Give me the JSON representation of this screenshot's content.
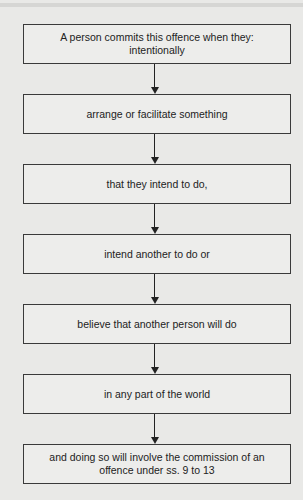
{
  "diagram": {
    "type": "flowchart",
    "direction": "top-to-bottom",
    "steps": [
      {
        "lines": [
          "A person commits this offence when they:",
          "intentionally"
        ]
      },
      {
        "lines": [
          "arrange or facilitate something"
        ]
      },
      {
        "lines": [
          "that they intend to do,"
        ]
      },
      {
        "lines": [
          "intend another to do or"
        ]
      },
      {
        "lines": [
          "believe that another person will do"
        ]
      },
      {
        "lines": [
          "in any part of the world"
        ]
      },
      {
        "lines": [
          "and doing so will involve the commission of an",
          "offence under ss. 9 to 13"
        ]
      }
    ],
    "colors": {
      "background": "#e9e9e7",
      "box_fill": "#ededeb",
      "border": "#3a3a3a",
      "text": "#222222"
    }
  }
}
